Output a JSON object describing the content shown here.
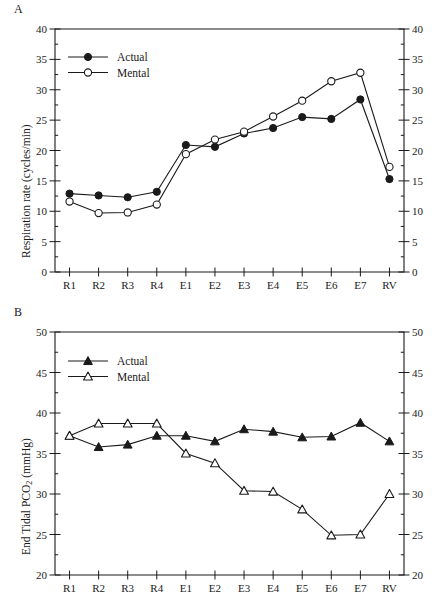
{
  "figure": {
    "panels": [
      {
        "letter": "A",
        "ylabel": "Respiration rate (cycles/min)",
        "ylabel_sub": "",
        "ymin": 0,
        "ymax": 40,
        "ystep": 5,
        "yticks": [
          "0",
          "5",
          "10",
          "15",
          "20",
          "25",
          "30",
          "35",
          "40"
        ],
        "legend": [
          {
            "label": "Actual",
            "marker": "filled-circle"
          },
          {
            "label": "Mental",
            "marker": "open-circle"
          }
        ]
      },
      {
        "letter": "B",
        "ylabel": "End Tidal PCO",
        "ylabel_sub": "2",
        "ylabel_tail": " (mmHg)",
        "ymin": 20,
        "ymax": 50,
        "ystep": 5,
        "yticks": [
          "20",
          "25",
          "30",
          "35",
          "40",
          "45",
          "50"
        ],
        "legend": [
          {
            "label": "Actual",
            "marker": "filled-triangle"
          },
          {
            "label": "Mental",
            "marker": "open-triangle"
          }
        ]
      }
    ]
  },
  "chart_data": [
    {
      "type": "line",
      "panel": "A",
      "title": "",
      "xlabel": "",
      "ylabel": "Respiration rate (cycles/min)",
      "categories": [
        "R1",
        "R2",
        "R3",
        "R4",
        "E1",
        "E2",
        "E3",
        "E4",
        "E5",
        "E6",
        "E7",
        "RV"
      ],
      "ylim": [
        0,
        40
      ],
      "ytick_step": 5,
      "grid": false,
      "legend_position": "top-left-inside",
      "series": [
        {
          "name": "Actual",
          "marker": "filled-circle",
          "values": [
            12.9,
            12.6,
            12.3,
            13.2,
            20.9,
            20.6,
            22.8,
            23.7,
            25.5,
            25.2,
            28.4,
            15.3
          ]
        },
        {
          "name": "Mental",
          "marker": "open-circle",
          "values": [
            11.6,
            9.7,
            9.8,
            11.1,
            19.4,
            21.8,
            23.1,
            25.6,
            28.2,
            31.4,
            32.8,
            17.3
          ]
        }
      ]
    },
    {
      "type": "line",
      "panel": "B",
      "title": "",
      "xlabel": "",
      "ylabel": "End Tidal PCO2 (mmHg)",
      "categories": [
        "R1",
        "R2",
        "R3",
        "R4",
        "E1",
        "E2",
        "E3",
        "E4",
        "E5",
        "E6",
        "E7",
        "RV"
      ],
      "ylim": [
        20,
        50
      ],
      "ytick_step": 5,
      "grid": false,
      "legend_position": "top-left-inside",
      "series": [
        {
          "name": "Actual",
          "marker": "filled-triangle",
          "values": [
            37.2,
            35.8,
            36.1,
            37.2,
            37.2,
            36.5,
            38.0,
            37.7,
            37.0,
            37.1,
            38.8,
            36.5
          ]
        },
        {
          "name": "Mental",
          "marker": "open-triangle",
          "values": [
            37.2,
            38.7,
            38.7,
            38.7,
            35.0,
            33.8,
            30.4,
            30.3,
            28.1,
            24.9,
            25.0,
            30.0
          ]
        }
      ]
    }
  ]
}
